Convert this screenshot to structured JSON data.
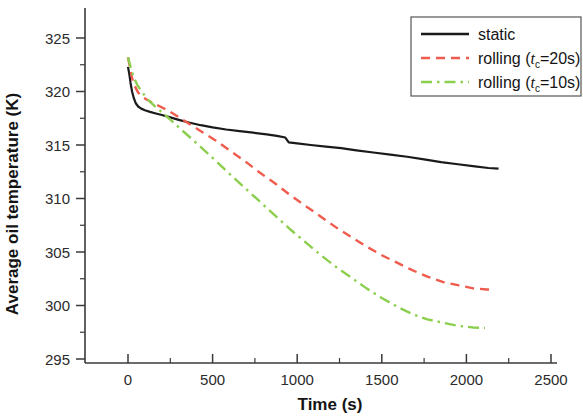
{
  "chart_data": {
    "type": "line",
    "title": "",
    "xlabel": "Time (s)",
    "ylabel": "Average oil temperature (K)",
    "xlim": [
      -250,
      2600
    ],
    "ylim": [
      293.5,
      326.8
    ],
    "xticks": [
      0,
      500,
      1000,
      1500,
      2000,
      2500
    ],
    "xtick_labels": [
      "0",
      "500",
      "1000",
      "1500",
      "2000",
      "2500"
    ],
    "yticks": [
      295,
      300,
      305,
      310,
      315,
      320,
      325
    ],
    "ytick_labels": [
      "295",
      "300",
      "305",
      "310",
      "315",
      "320",
      "325"
    ],
    "minor_ticks": true,
    "grid": false,
    "legend_position": "top-right",
    "series": [
      {
        "name": "static",
        "legend_label": "static",
        "color": "#1a1a1a",
        "style": "solid",
        "width": 2.2,
        "points": [
          [
            0,
            322.3
          ],
          [
            8,
            321.6
          ],
          [
            15,
            320.8
          ],
          [
            24,
            320.0
          ],
          [
            34,
            319.4
          ],
          [
            46,
            318.9
          ],
          [
            60,
            318.6
          ],
          [
            78,
            318.4
          ],
          [
            100,
            318.25
          ],
          [
            130,
            318.1
          ],
          [
            165,
            317.95
          ],
          [
            200,
            317.8
          ],
          [
            245,
            317.6
          ],
          [
            300,
            317.35
          ],
          [
            360,
            317.1
          ],
          [
            430,
            316.85
          ],
          [
            500,
            316.65
          ],
          [
            580,
            316.45
          ],
          [
            660,
            316.3
          ],
          [
            740,
            316.15
          ],
          [
            820,
            316.0
          ],
          [
            880,
            315.85
          ],
          [
            930,
            315.7
          ],
          [
            950,
            315.25
          ],
          [
            1000,
            315.15
          ],
          [
            1080,
            315.0
          ],
          [
            1170,
            314.85
          ],
          [
            1260,
            314.7
          ],
          [
            1350,
            314.5
          ],
          [
            1450,
            314.3
          ],
          [
            1550,
            314.1
          ],
          [
            1650,
            313.9
          ],
          [
            1750,
            313.65
          ],
          [
            1850,
            313.4
          ],
          [
            1950,
            313.2
          ],
          [
            2050,
            313.0
          ],
          [
            2130,
            312.85
          ],
          [
            2190,
            312.8
          ]
        ]
      },
      {
        "name": "rolling_tc20",
        "legend_label": "rolling (t_c=20s)",
        "legend_prefix": "rolling (",
        "legend_var": "t",
        "legend_subscript": "c",
        "legend_suffix": "=20s)",
        "color": "#ef5b4c",
        "style": "dashed",
        "width": 2.4,
        "points": [
          [
            0,
            323.2
          ],
          [
            12,
            322.2
          ],
          [
            25,
            321.2
          ],
          [
            40,
            320.5
          ],
          [
            60,
            319.9
          ],
          [
            85,
            319.5
          ],
          [
            115,
            319.2
          ],
          [
            150,
            318.9
          ],
          [
            190,
            318.6
          ],
          [
            240,
            318.2
          ],
          [
            300,
            317.6
          ],
          [
            370,
            316.9
          ],
          [
            440,
            316.2
          ],
          [
            520,
            315.4
          ],
          [
            600,
            314.5
          ],
          [
            690,
            313.5
          ],
          [
            780,
            312.4
          ],
          [
            870,
            311.4
          ],
          [
            960,
            310.3
          ],
          [
            1050,
            309.3
          ],
          [
            1140,
            308.3
          ],
          [
            1230,
            307.3
          ],
          [
            1320,
            306.4
          ],
          [
            1410,
            305.5
          ],
          [
            1500,
            304.7
          ],
          [
            1590,
            304.0
          ],
          [
            1680,
            303.3
          ],
          [
            1770,
            302.7
          ],
          [
            1860,
            302.2
          ],
          [
            1950,
            301.9
          ],
          [
            2040,
            301.6
          ],
          [
            2120,
            301.5
          ],
          [
            2150,
            301.5
          ]
        ]
      },
      {
        "name": "rolling_tc10",
        "legend_label": "rolling (t_c=10s)",
        "legend_prefix": "rolling (",
        "legend_var": "t",
        "legend_subscript": "c",
        "legend_suffix": "=10s)",
        "color": "#8ccf4f",
        "style": "dashdot",
        "width": 2.4,
        "points": [
          [
            0,
            323.2
          ],
          [
            15,
            322.3
          ],
          [
            32,
            321.4
          ],
          [
            55,
            320.6
          ],
          [
            85,
            319.9
          ],
          [
            120,
            319.2
          ],
          [
            160,
            318.6
          ],
          [
            205,
            318.0
          ],
          [
            255,
            317.3
          ],
          [
            310,
            316.5
          ],
          [
            375,
            315.6
          ],
          [
            445,
            314.6
          ],
          [
            520,
            313.5
          ],
          [
            600,
            312.3
          ],
          [
            690,
            311.0
          ],
          [
            780,
            309.7
          ],
          [
            870,
            308.4
          ],
          [
            960,
            307.1
          ],
          [
            1050,
            305.9
          ],
          [
            1140,
            304.7
          ],
          [
            1230,
            303.6
          ],
          [
            1320,
            302.6
          ],
          [
            1410,
            301.6
          ],
          [
            1500,
            300.7
          ],
          [
            1590,
            299.9
          ],
          [
            1680,
            299.2
          ],
          [
            1770,
            298.7
          ],
          [
            1860,
            298.4
          ],
          [
            1950,
            298.1
          ],
          [
            2040,
            297.95
          ],
          [
            2110,
            297.9
          ]
        ]
      }
    ]
  },
  "axes": {
    "x_title": "Time (s)",
    "y_title": "Average oil temperature (K)"
  },
  "legend": {
    "items": [
      {
        "label": "static",
        "sample": "solid-black"
      },
      {
        "label": "rolling (t",
        "sub": "c",
        "tail": "=20s)",
        "sample": "dashed-red"
      },
      {
        "label": "rolling (t",
        "sub": "c",
        "tail": "=10s)",
        "sample": "dashdot-green"
      }
    ]
  },
  "colors": {
    "static": "#1a1a1a",
    "rolling_20s": "#ef5b4c",
    "rolling_10s": "#8ccf4f",
    "axis": "#3a3a3a",
    "background": "#ffffff"
  }
}
